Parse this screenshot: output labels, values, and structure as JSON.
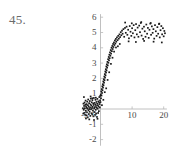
{
  "figure": {
    "problem_number": "45.",
    "caption": ""
  },
  "colors": {
    "background": "#ffffff",
    "axis": "#b9b9b9",
    "point": "#1a1a1a",
    "tick_text": "#4a4a4a",
    "number_text": "#6b6b6b"
  },
  "axes": {
    "x_ticks": [
      {
        "value": -5,
        "label": "-5"
      },
      {
        "value": 10,
        "label": "10"
      },
      {
        "value": 20,
        "label": "20"
      }
    ],
    "y_ticks": [
      {
        "value": 6,
        "label": "6"
      },
      {
        "value": 5,
        "label": "5"
      },
      {
        "value": 4,
        "label": "4"
      },
      {
        "value": 3,
        "label": "3"
      },
      {
        "value": 2,
        "label": "2"
      },
      {
        "value": 1,
        "label": "1"
      },
      {
        "value": 0,
        "label": "0"
      },
      {
        "value": -1,
        "label": "-1"
      },
      {
        "value": -2,
        "label": "-2"
      }
    ]
  },
  "chart_data": {
    "type": "scatter",
    "title": "",
    "xlabel": "",
    "ylabel": "",
    "xlim": [
      -6,
      21
    ],
    "ylim": [
      -2.4,
      6.2
    ],
    "grid": false,
    "legend": null,
    "xticks": [
      -5,
      10,
      20
    ],
    "yticks": [
      -2,
      -1,
      0,
      1,
      2,
      3,
      4,
      5,
      6
    ],
    "series": [
      {
        "name": "observations",
        "marker": "filled-square",
        "color": "#1a1a1a",
        "description": "Noisy logistic (sigmoid) response rising from about 0 near x=-5 to about 5 for x>6",
        "points": [
          [
            -5.55,
            0.05
          ],
          [
            -5.45,
            -0.3
          ],
          [
            -5.4,
            0.35
          ],
          [
            -5.3,
            -0.05
          ],
          [
            -5.2,
            0.2
          ],
          [
            -5.12,
            -0.25
          ],
          [
            -5.05,
            0.42
          ],
          [
            -4.95,
            0.05
          ],
          [
            -4.88,
            -0.38
          ],
          [
            -4.8,
            0.28
          ],
          [
            -4.72,
            0.55
          ],
          [
            -4.65,
            -0.12
          ],
          [
            -4.58,
            0.18
          ],
          [
            -4.5,
            -0.42
          ],
          [
            -4.42,
            0.32
          ],
          [
            -4.35,
            0.08
          ],
          [
            -4.28,
            -0.22
          ],
          [
            -4.2,
            0.48
          ],
          [
            -4.12,
            0.02
          ],
          [
            -4.05,
            -0.55
          ],
          [
            -3.98,
            0.25
          ],
          [
            -3.9,
            0.62
          ],
          [
            -3.82,
            -0.08
          ],
          [
            -3.75,
            0.15
          ],
          [
            -3.68,
            -0.33
          ],
          [
            -3.6,
            0.38
          ],
          [
            -3.52,
            0.0
          ],
          [
            -3.45,
            -0.18
          ],
          [
            -3.38,
            0.52
          ],
          [
            -3.3,
            0.1
          ],
          [
            -3.22,
            -0.45
          ],
          [
            -3.15,
            0.3
          ],
          [
            -3.08,
            0.68
          ],
          [
            -3.0,
            -0.02
          ],
          [
            -2.92,
            0.22
          ],
          [
            -2.85,
            -0.28
          ],
          [
            -2.78,
            0.44
          ],
          [
            -2.7,
            0.06
          ],
          [
            -2.62,
            -0.35
          ],
          [
            -2.55,
            0.58
          ],
          [
            -2.48,
            0.14
          ],
          [
            -2.4,
            -0.1
          ],
          [
            -2.32,
            0.36
          ],
          [
            -2.25,
            -0.48
          ],
          [
            -2.18,
            0.26
          ],
          [
            -2.1,
            0.72
          ],
          [
            -2.02,
            0.04
          ],
          [
            -1.95,
            -0.2
          ],
          [
            -1.88,
            0.4
          ],
          [
            -1.8,
            0.12
          ],
          [
            -1.72,
            -0.38
          ],
          [
            -1.65,
            0.3
          ],
          [
            -1.58,
            0.6
          ],
          [
            -1.5,
            -0.05
          ],
          [
            -1.42,
            0.2
          ],
          [
            -1.35,
            -0.3
          ],
          [
            -1.28,
            0.46
          ],
          [
            -1.2,
            0.08
          ],
          [
            -1.12,
            -0.52
          ],
          [
            -1.05,
            0.34
          ],
          [
            -0.98,
            0.66
          ],
          [
            -0.9,
            0.02
          ],
          [
            -0.82,
            0.24
          ],
          [
            -0.75,
            -0.26
          ],
          [
            -0.68,
            0.5
          ],
          [
            -0.6,
            0.16
          ],
          [
            -0.52,
            -0.14
          ],
          [
            -0.45,
            0.42
          ],
          [
            -0.38,
            0.78
          ],
          [
            -0.3,
            0.32
          ],
          [
            -0.22,
            0.1
          ],
          [
            -0.15,
            0.56
          ],
          [
            -0.08,
            0.86
          ],
          [
            0.0,
            0.45
          ],
          [
            0.08,
            0.95
          ],
          [
            0.16,
            0.7
          ],
          [
            0.24,
            1.15
          ],
          [
            0.32,
            0.88
          ],
          [
            0.4,
            1.3
          ],
          [
            0.48,
            1.05
          ],
          [
            0.56,
            1.48
          ],
          [
            0.64,
            1.22
          ],
          [
            0.72,
            1.62
          ],
          [
            0.8,
            1.4
          ],
          [
            0.88,
            1.8
          ],
          [
            0.96,
            1.55
          ],
          [
            1.04,
            1.95
          ],
          [
            1.12,
            1.72
          ],
          [
            1.2,
            2.12
          ],
          [
            1.28,
            1.88
          ],
          [
            1.36,
            2.28
          ],
          [
            1.44,
            2.05
          ],
          [
            1.52,
            2.45
          ],
          [
            1.6,
            2.2
          ],
          [
            1.68,
            2.6
          ],
          [
            1.76,
            2.38
          ],
          [
            1.84,
            2.78
          ],
          [
            1.92,
            2.52
          ],
          [
            2.0,
            2.92
          ],
          [
            2.1,
            2.7
          ],
          [
            2.2,
            3.08
          ],
          [
            2.3,
            2.85
          ],
          [
            2.4,
            3.25
          ],
          [
            2.5,
            3.02
          ],
          [
            2.6,
            3.4
          ],
          [
            2.7,
            3.18
          ],
          [
            2.8,
            3.55
          ],
          [
            2.9,
            3.32
          ],
          [
            3.0,
            3.7
          ],
          [
            3.12,
            3.48
          ],
          [
            3.24,
            3.85
          ],
          [
            3.36,
            3.62
          ],
          [
            3.48,
            4.0
          ],
          [
            3.6,
            3.78
          ],
          [
            3.72,
            4.12
          ],
          [
            3.85,
            3.92
          ],
          [
            3.98,
            4.25
          ],
          [
            4.1,
            4.05
          ],
          [
            4.25,
            4.35
          ],
          [
            4.4,
            4.18
          ],
          [
            4.55,
            4.48
          ],
          [
            4.7,
            4.28
          ],
          [
            4.85,
            4.58
          ],
          [
            5.0,
            4.4
          ],
          [
            5.2,
            4.68
          ],
          [
            5.4,
            4.5
          ],
          [
            5.6,
            4.78
          ],
          [
            5.8,
            4.6
          ],
          [
            6.0,
            4.88
          ],
          [
            6.2,
            4.7
          ],
          [
            6.4,
            5.02
          ],
          [
            6.6,
            4.82
          ],
          [
            6.8,
            5.12
          ],
          [
            7.0,
            4.92
          ],
          [
            7.25,
            5.22
          ],
          [
            7.5,
            4.72
          ],
          [
            7.75,
            5.3
          ],
          [
            8.0,
            4.98
          ],
          [
            8.25,
            5.38
          ],
          [
            8.5,
            4.85
          ],
          [
            8.75,
            5.18
          ],
          [
            9.0,
            4.62
          ],
          [
            9.25,
            5.42
          ],
          [
            9.5,
            5.05
          ],
          [
            9.75,
            4.78
          ],
          [
            10.0,
            5.28
          ],
          [
            10.25,
            4.95
          ],
          [
            10.5,
            5.48
          ],
          [
            10.75,
            4.68
          ],
          [
            11.0,
            5.15
          ],
          [
            11.25,
            5.55
          ],
          [
            11.5,
            4.88
          ],
          [
            11.75,
            5.32
          ],
          [
            12.0,
            4.72
          ],
          [
            12.25,
            5.45
          ],
          [
            12.5,
            5.02
          ],
          [
            12.75,
            5.62
          ],
          [
            13.0,
            4.8
          ],
          [
            13.25,
            5.25
          ],
          [
            13.5,
            4.58
          ],
          [
            13.75,
            5.38
          ],
          [
            14.0,
            5.08
          ],
          [
            14.25,
            4.72
          ],
          [
            14.5,
            5.52
          ],
          [
            14.75,
            4.92
          ],
          [
            15.0,
            5.3
          ],
          [
            15.25,
            4.65
          ],
          [
            15.5,
            5.18
          ],
          [
            15.75,
            5.58
          ],
          [
            16.0,
            4.85
          ],
          [
            16.25,
            5.4
          ],
          [
            16.5,
            4.98
          ],
          [
            16.75,
            5.22
          ],
          [
            17.0,
            4.6
          ],
          [
            17.25,
            5.48
          ],
          [
            17.5,
            5.08
          ],
          [
            17.75,
            4.78
          ],
          [
            18.0,
            5.35
          ],
          [
            18.25,
            4.92
          ],
          [
            18.5,
            5.55
          ],
          [
            18.75,
            4.68
          ],
          [
            19.0,
            5.15
          ],
          [
            19.25,
            5.42
          ],
          [
            19.5,
            4.88
          ],
          [
            19.75,
            5.28
          ],
          [
            20.0,
            4.75
          ],
          [
            20.2,
            5.1
          ],
          [
            20.4,
            4.95
          ],
          [
            -4.6,
            -0.62
          ],
          [
            -3.55,
            -0.68
          ],
          [
            -2.05,
            -0.72
          ],
          [
            -0.95,
            -0.64
          ],
          [
            -5.25,
            0.78
          ],
          [
            -3.12,
            0.82
          ],
          [
            -1.48,
            0.74
          ],
          [
            -2.62,
            0.7
          ],
          [
            7.8,
            5.65
          ],
          [
            9.9,
            5.6
          ],
          [
            12.9,
            5.68
          ],
          [
            15.9,
            5.62
          ],
          [
            18.6,
            5.58
          ],
          [
            8.9,
            4.42
          ],
          [
            11.2,
            4.38
          ],
          [
            13.8,
            4.45
          ],
          [
            16.8,
            4.4
          ],
          [
            19.4,
            4.35
          ],
          [
            6.1,
            4.25
          ],
          [
            5.5,
            4.1
          ],
          [
            4.9,
            4.02
          ],
          [
            0.45,
            0.25
          ],
          [
            0.9,
            0.6
          ],
          [
            1.35,
            1.1
          ],
          [
            1.8,
            1.35
          ],
          [
            2.25,
            1.9
          ],
          [
            2.75,
            2.4
          ],
          [
            3.3,
            2.95
          ],
          [
            3.8,
            3.35
          ],
          [
            4.3,
            3.75
          ]
        ]
      }
    ]
  }
}
